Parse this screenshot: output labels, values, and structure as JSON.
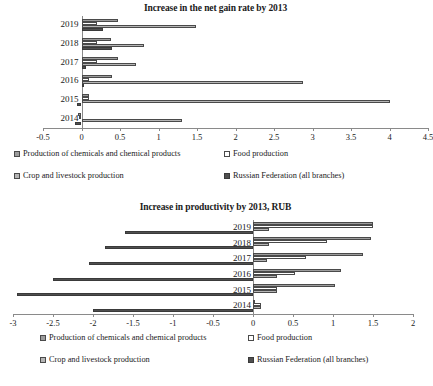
{
  "charts": [
    {
      "id": "net-gain-rate",
      "title": "Increase in the net gain rate by 2013",
      "categories": [
        "2019",
        "2018",
        "2017",
        "2016",
        "2015",
        "2014"
      ],
      "xticks": [
        "-0.5",
        "0",
        "0.5",
        "1",
        "1.5",
        "2",
        "2.5",
        "3",
        "3.5",
        "4",
        "4.5"
      ],
      "xlim": [
        -0.5,
        4.5
      ],
      "series": [
        {
          "name": "Production of chemicals and chemical products",
          "values": [
            0.48,
            0.38,
            0.48,
            0.39,
            0.1,
            -0.04
          ]
        },
        {
          "name": "Food production",
          "values": [
            0.2,
            0.2,
            0.2,
            0.1,
            0.1,
            -0.03
          ]
        },
        {
          "name": "Crop and livestock production",
          "values": [
            1.49,
            0.81,
            0.71,
            2.88,
            4.0,
            1.3
          ]
        },
        {
          "name": "Russian Federation (all branches)",
          "values": [
            0.28,
            0.39,
            0.06,
            0.0,
            -0.06,
            -0.09
          ]
        }
      ]
    },
    {
      "id": "productivity",
      "title": "Increase in productivity by 2013, RUB",
      "categories": [
        "2019",
        "2018",
        "2017",
        "2016",
        "2015",
        "2014"
      ],
      "xticks": [
        "-3",
        "-2.5",
        "-2",
        "-1.5",
        "-1",
        "-0.5",
        "0",
        "0.5",
        "1",
        "1.5",
        "2"
      ],
      "xlim": [
        -3,
        2
      ],
      "series": [
        {
          "name": "Production of chemicals and chemical products",
          "values": [
            1.5,
            1.47,
            1.37,
            1.1,
            1.02,
            0.0
          ]
        },
        {
          "name": "Food production",
          "values": [
            1.5,
            0.92,
            0.66,
            0.52,
            0.3,
            0.1
          ]
        },
        {
          "name": "Crop and livestock production",
          "values": [
            0.2,
            0.2,
            0.17,
            0.3,
            0.3,
            0.1
          ]
        },
        {
          "name": "Russian Federation (all branches)",
          "values": [
            -1.6,
            -1.85,
            -2.05,
            -2.5,
            -2.95,
            -2.0
          ]
        }
      ]
    }
  ],
  "legend": {
    "items": [
      {
        "label": "Production of chemicals and chemical products",
        "swatch": "series-0-swatch"
      },
      {
        "label": "Food production",
        "swatch": "series-1-swatch"
      },
      {
        "label": "Crop and livestock production",
        "swatch": "series-2-swatch"
      },
      {
        "label": "Russian Federation (all branches)",
        "swatch": "series-3-swatch"
      }
    ]
  },
  "chart_data": {
    "type": "bar",
    "orientation": "horizontal",
    "charts": [
      {
        "title": "Increase in the net gain rate by 2013",
        "xlabel": "",
        "ylabel": "",
        "xlim": [
          -0.5,
          4.5
        ],
        "xticks": [
          -0.5,
          0,
          0.5,
          1,
          1.5,
          2,
          2.5,
          3,
          3.5,
          4,
          4.5
        ],
        "grid": false,
        "legend_position": "bottom",
        "categories": [
          "2019",
          "2018",
          "2017",
          "2016",
          "2015",
          "2014"
        ],
        "series": [
          {
            "name": "Production of chemicals and chemical products",
            "values": [
              0.48,
              0.38,
              0.48,
              0.39,
              0.1,
              -0.04
            ]
          },
          {
            "name": "Food production",
            "values": [
              0.2,
              0.2,
              0.2,
              0.1,
              0.1,
              -0.03
            ]
          },
          {
            "name": "Crop and livestock production",
            "values": [
              1.49,
              0.81,
              0.71,
              2.88,
              4.0,
              1.3
            ]
          },
          {
            "name": "Russian Federation (all branches)",
            "values": [
              0.28,
              0.39,
              0.06,
              0.0,
              -0.06,
              -0.09
            ]
          }
        ]
      },
      {
        "title": "Increase in productivity by 2013, RUB",
        "xlabel": "",
        "ylabel": "",
        "xlim": [
          -3,
          2
        ],
        "xticks": [
          -3,
          -2.5,
          -2,
          -1.5,
          -1,
          -0.5,
          0,
          0.5,
          1,
          1.5,
          2
        ],
        "grid": false,
        "legend_position": "bottom",
        "categories": [
          "2019",
          "2018",
          "2017",
          "2016",
          "2015",
          "2014"
        ],
        "series": [
          {
            "name": "Production of chemicals and chemical products",
            "values": [
              1.5,
              1.47,
              1.37,
              1.1,
              1.02,
              0.0
            ]
          },
          {
            "name": "Food production",
            "values": [
              1.5,
              0.92,
              0.66,
              0.52,
              0.3,
              0.1
            ]
          },
          {
            "name": "Crop and livestock production",
            "values": [
              0.2,
              0.2,
              0.17,
              0.3,
              0.3,
              0.1
            ]
          },
          {
            "name": "Russian Federation (all branches)",
            "values": [
              -1.6,
              -1.85,
              -2.05,
              -2.5,
              -2.95,
              -2.0
            ]
          }
        ]
      }
    ]
  }
}
